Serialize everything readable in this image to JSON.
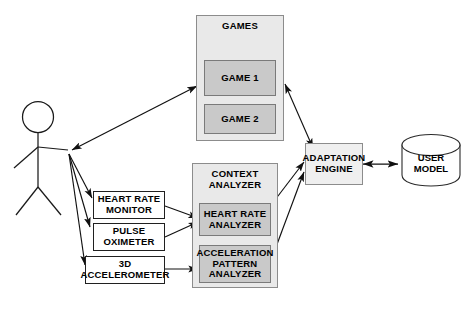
{
  "diagram": {
    "background_color": "#ffffff",
    "container_fill": "#e9e9e9",
    "inner_fill": "#c9c9c9",
    "plain_fill": "#ffffff",
    "stroke_color": "#202020",
    "container_stroke": "#8c8c8c"
  },
  "actor": {
    "name": "player-stick-figure",
    "label": ""
  },
  "games": {
    "container_label": "GAMES",
    "items": [
      {
        "label": "GAME 1"
      },
      {
        "label": "GAME 2"
      }
    ]
  },
  "context_analyzer": {
    "container_label": "CONTEXT\nANALYZER",
    "items": [
      {
        "label": "HEART RATE\nANALYZER"
      },
      {
        "label": "ACCELERATION\nPATTERN\nANALYZER"
      }
    ]
  },
  "sensors": [
    {
      "label": "HEART RATE\nMONITOR"
    },
    {
      "label": "PULSE\nOXIMETER"
    },
    {
      "label": "3D\nACCELEROMETER"
    }
  ],
  "adaptation_engine": {
    "label": "ADAPTATION\nENGINE"
  },
  "user_model": {
    "label": "USER\nMODEL"
  },
  "connections": [
    {
      "from": "player",
      "to": "games",
      "type": "bidirectional"
    },
    {
      "from": "player",
      "to": "heart-rate-monitor",
      "type": "directed"
    },
    {
      "from": "player",
      "to": "pulse-oximeter",
      "type": "directed"
    },
    {
      "from": "player",
      "to": "3d-accelerometer",
      "type": "directed"
    },
    {
      "from": "heart-rate-monitor",
      "to": "heart-rate-analyzer",
      "type": "directed"
    },
    {
      "from": "pulse-oximeter",
      "to": "heart-rate-analyzer",
      "type": "directed"
    },
    {
      "from": "3d-accelerometer",
      "to": "acceleration-pattern-analyzer",
      "type": "directed"
    },
    {
      "from": "heart-rate-analyzer",
      "to": "adaptation-engine",
      "type": "directed"
    },
    {
      "from": "acceleration-pattern-analyzer",
      "to": "adaptation-engine",
      "type": "directed"
    },
    {
      "from": "games",
      "to": "adaptation-engine",
      "type": "bidirectional"
    },
    {
      "from": "adaptation-engine",
      "to": "user-model",
      "type": "bidirectional"
    }
  ]
}
